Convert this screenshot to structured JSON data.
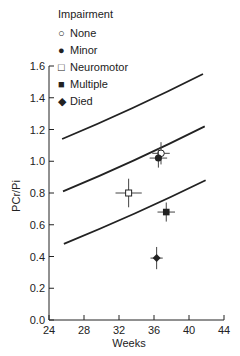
{
  "chart_data": {
    "type": "scatter",
    "title": "",
    "xlabel": "Weeks",
    "ylabel": "PCr/Pi",
    "xlim": [
      24,
      44
    ],
    "ylim": [
      0.0,
      1.6
    ],
    "xticks": [
      24,
      28,
      32,
      36,
      40,
      44
    ],
    "yticks": [
      0.0,
      0.2,
      0.4,
      0.6,
      0.8,
      1.0,
      1.2,
      1.4,
      1.6
    ],
    "grid": false,
    "legend": {
      "title": "Impairment",
      "position": "top-left",
      "entries": [
        {
          "label": "None",
          "marker": "open-circle"
        },
        {
          "label": "Minor",
          "marker": "filled-circle"
        },
        {
          "label": "Neuromotor",
          "marker": "open-square"
        },
        {
          "label": "Multiple",
          "marker": "filled-square"
        },
        {
          "label": "Died",
          "marker": "filled-diamond"
        }
      ]
    },
    "series": [
      {
        "name": "None",
        "marker": "open-circle",
        "x": 36.8,
        "y": 1.05,
        "xerr": 1.0,
        "yerr": 0.07
      },
      {
        "name": "Minor",
        "marker": "filled-circle",
        "x": 36.5,
        "y": 1.02,
        "xerr": 1.0,
        "yerr": 0.06
      },
      {
        "name": "Neuromotor",
        "marker": "open-square",
        "x": 33.1,
        "y": 0.8,
        "xerr": 1.5,
        "yerr": 0.09
      },
      {
        "name": "Multiple",
        "marker": "filled-square",
        "x": 37.4,
        "y": 0.68,
        "xerr": 1.0,
        "yerr": 0.06
      },
      {
        "name": "Died",
        "marker": "filled-diamond",
        "x": 36.3,
        "y": 0.39,
        "xerr": 0.7,
        "yerr": 0.07
      }
    ],
    "reference_lines": [
      {
        "name": "upper",
        "x": [
          25.5,
          41.6
        ],
        "y": [
          1.14,
          1.55
        ]
      },
      {
        "name": "middle",
        "x": [
          25.6,
          41.8
        ],
        "y": [
          0.81,
          1.22
        ]
      },
      {
        "name": "lower",
        "x": [
          25.7,
          41.9
        ],
        "y": [
          0.48,
          0.88
        ]
      }
    ]
  }
}
